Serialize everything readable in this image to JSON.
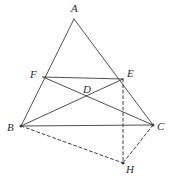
{
  "figure": {
    "type": "geometry-diagram",
    "canvas": {
      "width": 176,
      "height": 186
    },
    "background_color": "#ffffff",
    "stroke_color": "#3c3c3c",
    "label_color": "#2b2b2b",
    "solid_stroke_width": 0.9,
    "dashed_stroke_width": 1.0,
    "dash_pattern": "3,2.6",
    "points": [
      {
        "id": "A",
        "label": "A",
        "x": 74,
        "y": 19,
        "label_x": 71,
        "label_y": 3,
        "dot": false
      },
      {
        "id": "B",
        "label": "B",
        "x": 21,
        "y": 126,
        "label_x": 7,
        "label_y": 122,
        "dot": true
      },
      {
        "id": "C",
        "label": "C",
        "x": 153,
        "y": 125,
        "label_x": 157,
        "label_y": 121,
        "dot": true
      },
      {
        "id": "D",
        "label": "D",
        "x": 85,
        "y": 95,
        "label_x": 83,
        "label_y": 84,
        "dot": false
      },
      {
        "id": "E",
        "label": "E",
        "x": 123,
        "y": 79,
        "label_x": 127,
        "label_y": 68,
        "dot": false
      },
      {
        "id": "F",
        "label": "F",
        "x": 43,
        "y": 77,
        "label_x": 30,
        "label_y": 69,
        "dot": false
      },
      {
        "id": "H",
        "label": "H",
        "x": 123,
        "y": 163,
        "label_x": 126,
        "label_y": 164,
        "dot": true
      }
    ],
    "solid_segments": [
      {
        "name": "side-ab",
        "from": "A",
        "to": "B"
      },
      {
        "name": "side-ac",
        "from": "A",
        "to": "C"
      },
      {
        "name": "side-bc",
        "from": "B",
        "to": "C"
      },
      {
        "name": "segment-fe",
        "from": "F",
        "to": "E"
      },
      {
        "name": "cevian-fc",
        "from": "F",
        "to": "C"
      },
      {
        "name": "cevian-be",
        "from": "B",
        "to": "E"
      }
    ],
    "dashed_segments": [
      {
        "name": "segment-eh",
        "from": "E",
        "to": "H"
      },
      {
        "name": "segment-bh",
        "from": "B",
        "to": "H"
      },
      {
        "name": "segment-ch",
        "from": "C",
        "to": "H"
      }
    ]
  }
}
